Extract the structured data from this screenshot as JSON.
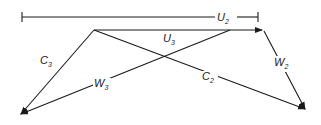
{
  "diagram": {
    "type": "velocity-triangle",
    "labels": {
      "U2": {
        "main": "U",
        "sub": "2"
      },
      "U3": {
        "main": "U",
        "sub": "3"
      },
      "C2": {
        "main": "C",
        "sub": "2"
      },
      "C3": {
        "main": "C",
        "sub": "3"
      },
      "W2": {
        "main": "W",
        "sub": "2"
      },
      "W3": {
        "main": "W",
        "sub": "3"
      }
    },
    "colors": {
      "line": "#1a1a1a",
      "background": "#ffffff"
    }
  }
}
